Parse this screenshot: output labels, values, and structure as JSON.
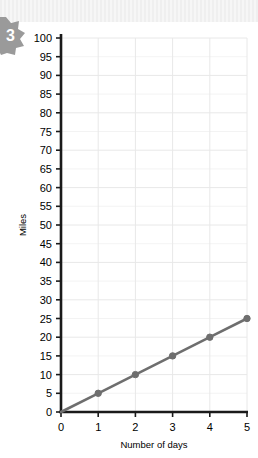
{
  "badge": {
    "number": "3",
    "icon": "star-burst-badge",
    "color": "#9a9a9a"
  },
  "chart_data": {
    "type": "line",
    "title": "",
    "subtitle": "",
    "xlabel": "Number of days",
    "ylabel": "Miles",
    "x": [
      0,
      1,
      2,
      3,
      4,
      5
    ],
    "values": [
      0,
      5,
      10,
      15,
      20,
      25
    ],
    "series": [
      {
        "name": "Miles traveled",
        "values": [
          0,
          5,
          10,
          15,
          20,
          25
        ]
      }
    ],
    "xlim": [
      0,
      5
    ],
    "ylim": [
      0,
      100
    ],
    "x_tick_labels": [
      "0",
      "1",
      "2",
      "3",
      "4",
      "5"
    ],
    "y_tick_labels": [
      "0",
      "5",
      "10",
      "15",
      "20",
      "25",
      "30",
      "35",
      "40",
      "45",
      "50",
      "55",
      "60",
      "65",
      "70",
      "75",
      "80",
      "85",
      "90",
      "95",
      "100"
    ],
    "y_tick_step": 5,
    "x_tick_step": 1,
    "grid": true,
    "grid_color": "#e8e8e8",
    "legend": false,
    "legend_position": "none",
    "line_color": "#6e6e6e",
    "marker_color": "#6e6e6e",
    "marker_shape": "circle",
    "axis_color": "#1a1a1a",
    "annotations": []
  }
}
